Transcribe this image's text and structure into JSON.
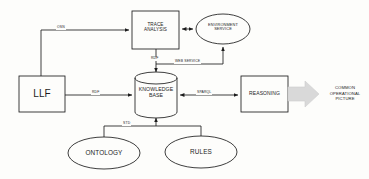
{
  "diagram": {
    "background_color": "#fdfdfb",
    "stroke_color": "#1c1c1c",
    "arrow_fill_color": "#d9d9d9"
  },
  "nodes": {
    "llf": {
      "label": "LLF",
      "shape": "rectangle"
    },
    "trace_analysis": {
      "label": "TRACE\nANALYSIS",
      "shape": "rectangle"
    },
    "environment_service": {
      "label": "ENVIRONMENT\nSERVICE",
      "shape": "ellipse"
    },
    "knowledge_base": {
      "label": "KNOWLEDGE\nBASE",
      "shape": "cylinder"
    },
    "reasoning": {
      "label": "REASONING",
      "shape": "rectangle"
    },
    "ontology": {
      "label": "ONTOLOGY",
      "shape": "ellipse"
    },
    "rules": {
      "label": "RULES",
      "shape": "ellipse"
    },
    "common_operational_picture": {
      "label": "COMMON\nOPERATIONAL\nPICTURE",
      "shape": "text"
    }
  },
  "edges": [
    {
      "id": "llf-to-trace",
      "label": "OSN",
      "from": "llf",
      "to": "trace_analysis"
    },
    {
      "id": "trace-to-env",
      "label": "",
      "from": "trace_analysis",
      "to": "environment_service"
    },
    {
      "id": "trace-to-kb",
      "label": "RDF",
      "from": "trace_analysis",
      "to": "knowledge_base"
    },
    {
      "id": "web-service-to-env",
      "label": "WEB SERVICE",
      "from": "knowledge_base",
      "to": "environment_service"
    },
    {
      "id": "llf-to-kb",
      "label": "RDF",
      "from": "llf",
      "to": "knowledge_base"
    },
    {
      "id": "kb-to-reasoning",
      "label": "SPARQL",
      "from": "knowledge_base",
      "to": "reasoning"
    },
    {
      "id": "ontology-rules-to-kb",
      "label": "STD",
      "from": "ontology",
      "to": "knowledge_base"
    },
    {
      "id": "reasoning-to-cop",
      "label": "",
      "from": "reasoning",
      "to": "common_operational_picture"
    }
  ]
}
